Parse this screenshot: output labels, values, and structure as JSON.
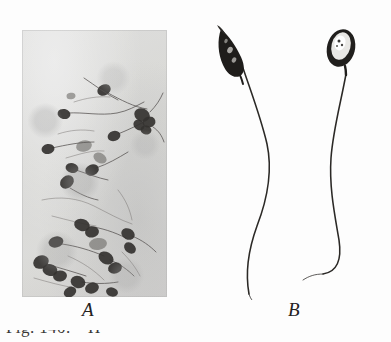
{
  "figure": {
    "medium": "halftone book plate, black and white",
    "background_color": "#ffffff",
    "panels": [
      {
        "id": "A",
        "label": "A",
        "kind": "photomicrograph",
        "subject": "spermatozoa smear",
        "plate_tone": "#e7e7e4",
        "ink_color": "#343230",
        "frame": {
          "x": 22,
          "y": 30,
          "width": 145,
          "height": 267
        }
      },
      {
        "id": "B",
        "label": "B",
        "kind": "line-drawing",
        "subject": "two spermatozoa, side view and flat view",
        "ink_color": "#2b2926",
        "frame": {
          "x": 205,
          "y": 22,
          "width": 180,
          "height": 278
        },
        "specimens": [
          {
            "name": "left-spermatozoon",
            "head_view": "edge view, spindle shaped, dark",
            "tail": "long sinuous flagellum"
          },
          {
            "name": "right-spermatozoon",
            "head_view": "flat view, oval with pale centre",
            "tail": "long sinuous flagellum"
          }
        ]
      }
    ],
    "caption_fragment": "Fig. 140.—H"
  }
}
